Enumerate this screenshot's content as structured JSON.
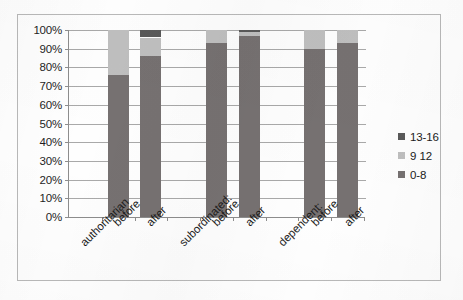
{
  "chart_data": {
    "type": "bar",
    "subtype": "100-percent-stacked-column",
    "title": "",
    "subtitle": "",
    "xlabel": "",
    "ylabel": "",
    "ylim": [
      0,
      100
    ],
    "ytick_labels": [
      "100%",
      "90%",
      "80%",
      "70%",
      "60%",
      "50%",
      "40%",
      "30%",
      "20%",
      "10%",
      "0%"
    ],
    "ytick_values": [
      100,
      90,
      80,
      70,
      60,
      50,
      40,
      30,
      20,
      10,
      0
    ],
    "grid": true,
    "legend_position": "right",
    "categories": [
      "authoritarian",
      "before",
      "after",
      "subordinated:",
      "before",
      "after",
      "dependent:",
      "before",
      "after"
    ],
    "category_is_group_header": [
      true,
      false,
      false,
      true,
      false,
      false,
      true,
      false,
      false
    ],
    "series": [
      {
        "name": "0-8",
        "color": "#767171",
        "values": [
          null,
          76,
          86,
          null,
          93,
          97,
          null,
          90,
          93
        ]
      },
      {
        "name": "9 12",
        "color": "#bfbfbf",
        "values": [
          null,
          24,
          10,
          null,
          7,
          2,
          null,
          10,
          7
        ]
      },
      {
        "name": "13-16",
        "color": "#595959",
        "values": [
          null,
          0,
          4,
          null,
          0,
          1,
          null,
          0,
          0
        ]
      }
    ],
    "legend": [
      {
        "label": "13-16",
        "color": "#595959"
      },
      {
        "label": "9 12",
        "color": "#bfbfbf"
      },
      {
        "label": "0-8",
        "color": "#767171"
      }
    ]
  },
  "colors": {
    "series_dark_top": "#595959",
    "series_light": "#bfbfbf",
    "series_dark_base": "#767171",
    "axis": "#8d8d8d",
    "grid": "#a9a9a9",
    "frame": "#b9b9b9",
    "text": "#1b1b1b"
  }
}
